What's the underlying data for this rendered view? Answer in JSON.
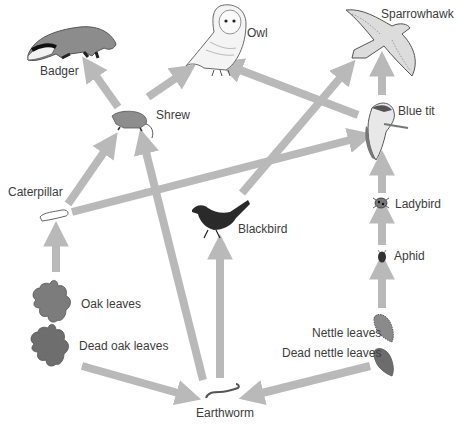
{
  "diagram": {
    "arrow_color": "#b9b9b9",
    "organisms": {
      "badger": "Badger",
      "owl": "Owl",
      "sparrowhawk": "Sparrowhawk",
      "shrew": "Shrew",
      "blue_tit": "Blue tit",
      "caterpillar": "Caterpillar",
      "blackbird": "Blackbird",
      "ladybird": "Ladybird",
      "aphid": "Aphid",
      "oak_leaves": "Oak leaves",
      "dead_oak_leaves": "Dead oak leaves",
      "nettle_leaves": "Nettle leaves",
      "dead_nettle_leaves": "Dead nettle leaves",
      "earthworm": "Earthworm"
    },
    "links": [
      {
        "from": "Shrew",
        "to": "Badger"
      },
      {
        "from": "Shrew",
        "to": "Owl"
      },
      {
        "from": "Blue tit",
        "to": "Owl"
      },
      {
        "from": "Blackbird",
        "to": "Sparrowhawk"
      },
      {
        "from": "Blue tit",
        "to": "Sparrowhawk"
      },
      {
        "from": "Caterpillar",
        "to": "Shrew"
      },
      {
        "from": "Earthworm",
        "to": "Shrew"
      },
      {
        "from": "Caterpillar",
        "to": "Blue tit"
      },
      {
        "from": "Ladybird",
        "to": "Blue tit"
      },
      {
        "from": "Aphid",
        "to": "Ladybird"
      },
      {
        "from": "Nettle leaves",
        "to": "Aphid"
      },
      {
        "from": "Oak leaves",
        "to": "Caterpillar"
      },
      {
        "from": "Earthworm",
        "to": "Blackbird"
      },
      {
        "from": "Dead oak leaves",
        "to": "Earthworm"
      },
      {
        "from": "Dead nettle leaves",
        "to": "Earthworm"
      }
    ]
  }
}
